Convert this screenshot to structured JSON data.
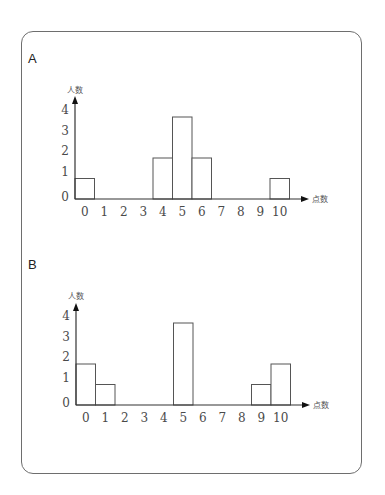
{
  "chart_data": [
    {
      "type": "bar",
      "panel": "A",
      "title": "A",
      "xlabel": "点数",
      "ylabel": "人数",
      "categories": [
        "0",
        "1",
        "2",
        "3",
        "4",
        "5",
        "6",
        "7",
        "8",
        "9",
        "10"
      ],
      "values": [
        1,
        0,
        0,
        0,
        2,
        4,
        2,
        0,
        0,
        0,
        1
      ],
      "yticks": [
        "0",
        "1",
        "2",
        "3",
        "4"
      ],
      "ylim": [
        0,
        4
      ],
      "grid": false,
      "legend": null
    },
    {
      "type": "bar",
      "panel": "B",
      "title": "B",
      "xlabel": "点数",
      "ylabel": "人数",
      "categories": [
        "0",
        "1",
        "2",
        "3",
        "4",
        "5",
        "6",
        "7",
        "8",
        "9",
        "10"
      ],
      "values": [
        2,
        1,
        0,
        0,
        0,
        4,
        0,
        0,
        0,
        1,
        2
      ],
      "yticks": [
        "0",
        "1",
        "2",
        "3",
        "4"
      ],
      "ylim": [
        0,
        4
      ],
      "grid": false,
      "legend": null
    }
  ],
  "panels": {
    "a": {
      "label": "A"
    },
    "b": {
      "label": "B"
    }
  },
  "style": {
    "bar_fill": "#ffffff",
    "bar_stroke": "#555555",
    "axis_color": "#333333",
    "frame_color": "#6e6e6e"
  }
}
